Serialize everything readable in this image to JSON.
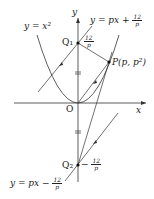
{
  "diagram": {
    "labels": {
      "y_axis": "y",
      "x_axis": "x",
      "origin": "O",
      "parabola": "y = x²",
      "line_upper": "y = px +",
      "line_lower": "y = px −",
      "q1": "Q₁",
      "q2": "Q₂",
      "point_p": "P(p, p²)",
      "frac_num": "12",
      "frac_den": "p",
      "q2_minus": "−"
    }
  }
}
